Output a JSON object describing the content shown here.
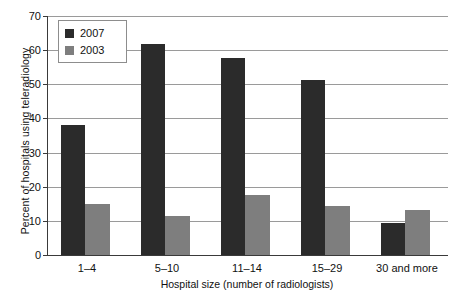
{
  "chart_data": {
    "type": "bar",
    "title": "",
    "xlabel": "Hospital size (number of radiologists)",
    "ylabel": "Percent of hospitals using teleradiology",
    "categories": [
      "1–4",
      "5–10",
      "11–14",
      "15–29",
      "30 and more"
    ],
    "series": [
      {
        "name": "2007",
        "color": "#2b2b2b",
        "values": [
          38,
          61.8,
          57.7,
          51.3,
          9.4
        ]
      },
      {
        "name": "2003",
        "color": "#7e7e7e",
        "values": [
          14.8,
          11.5,
          17.6,
          14.3,
          13.2
        ]
      }
    ],
    "ylim": [
      0,
      70
    ],
    "yticks": [
      0,
      10,
      20,
      30,
      40,
      50,
      60,
      70
    ],
    "ytick_labels": [
      "0",
      "10",
      "20",
      "30",
      "40",
      "50",
      "60",
      "70"
    ],
    "grid": "horizontal",
    "legend_position": "top-left",
    "legend_entries": [
      "2007",
      "2003"
    ]
  }
}
